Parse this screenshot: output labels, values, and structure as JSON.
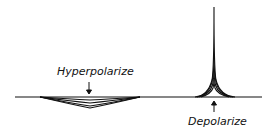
{
  "labels": {
    "hyperpolarize": "Hyperpolarize",
    "depolarize": "Depolarize"
  },
  "colors": {
    "trace": "#111111",
    "background": "#ffffff"
  }
}
